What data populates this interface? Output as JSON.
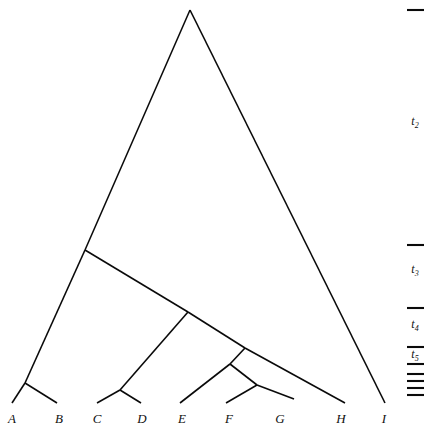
{
  "figure": {
    "kind": "phylogenetic-tree-diagram",
    "width": 428,
    "height": 428,
    "background_color": "#ffffff",
    "line_color": "#0a0a0a"
  },
  "chart_data": {
    "type": "diagram",
    "subtype": "cladogram",
    "title": "",
    "xlabel": "",
    "ylabel": "",
    "grid": false,
    "legend": null,
    "taxa": [
      {
        "id": "A",
        "label": "A",
        "x": 12,
        "y": 403,
        "label_x": 12,
        "label_y": 411
      },
      {
        "id": "B",
        "label": "B",
        "x": 55,
        "y": 403,
        "label_x": 59,
        "label_y": 411
      },
      {
        "id": "C",
        "label": "C",
        "x": 97,
        "y": 403,
        "label_x": 97,
        "label_y": 411
      },
      {
        "id": "D",
        "label": "D",
        "x": 138,
        "y": 403,
        "label_x": 142,
        "label_y": 411
      },
      {
        "id": "E",
        "label": "E",
        "x": 180,
        "y": 403,
        "label_x": 182,
        "label_y": 411
      },
      {
        "id": "F",
        "label": "F",
        "x": 226,
        "y": 403,
        "label_x": 229,
        "label_y": 411
      },
      {
        "id": "G",
        "label": "G",
        "x": 280,
        "y": 403,
        "label_x": 280,
        "label_y": 411
      },
      {
        "id": "H",
        "label": "H",
        "x": 345,
        "y": 403,
        "label_x": 341,
        "label_y": 411
      },
      {
        "id": "I",
        "label": "I",
        "x": 385,
        "y": 403,
        "label_x": 384,
        "label_y": 411
      }
    ],
    "internal_nodes": [
      {
        "id": "root",
        "x": 190,
        "y": 10
      },
      {
        "id": "n_left",
        "x": 85,
        "y": 250
      },
      {
        "id": "n_cde_fg",
        "x": 188,
        "y": 312
      },
      {
        "id": "n_efg",
        "x": 245,
        "y": 348
      },
      {
        "id": "n_fg_parent",
        "x": 230,
        "y": 364
      },
      {
        "id": "n_ab",
        "x": 25,
        "y": 383
      },
      {
        "id": "n_cd",
        "x": 120,
        "y": 390
      },
      {
        "id": "n_fg",
        "x": 257,
        "y": 385
      }
    ],
    "branches": [
      {
        "from": "root",
        "to": "n_left",
        "x1": 190,
        "y1": 10,
        "x2": 85,
        "y2": 250
      },
      {
        "from": "root",
        "to": "I",
        "x1": 190,
        "y1": 10,
        "x2": 385,
        "y2": 403
      },
      {
        "from": "n_left",
        "to": "n_ab",
        "x1": 85,
        "y1": 250,
        "x2": 25,
        "y2": 383
      },
      {
        "from": "n_left",
        "to": "n_cde_fg",
        "x1": 85,
        "y1": 250,
        "x2": 188,
        "y2": 312
      },
      {
        "from": "n_cde_fg",
        "to": "n_cd",
        "x1": 188,
        "y1": 312,
        "x2": 120,
        "y2": 390
      },
      {
        "from": "n_cde_fg",
        "to": "n_efg",
        "x1": 188,
        "y1": 312,
        "x2": 245,
        "y2": 348
      },
      {
        "from": "n_efg",
        "to": "n_fg_parent",
        "x1": 245,
        "y1": 348,
        "x2": 230,
        "y2": 364
      },
      {
        "from": "n_efg",
        "to": "H",
        "x1": 245,
        "y1": 348,
        "x2": 345,
        "y2": 403
      },
      {
        "from": "n_fg_parent",
        "to": "E",
        "x1": 230,
        "y1": 364,
        "x2": 180,
        "y2": 403
      },
      {
        "from": "n_fg_parent",
        "to": "n_fg",
        "x1": 230,
        "y1": 364,
        "x2": 257,
        "y2": 385
      },
      {
        "from": "n_fg",
        "to": "F",
        "x1": 257,
        "y1": 385,
        "x2": 226,
        "y2": 403
      },
      {
        "from": "n_fg",
        "to": "G",
        "x1": 257,
        "y1": 385,
        "x2": 294,
        "y2": 399
      },
      {
        "from": "n_ab",
        "to": "A",
        "x1": 25,
        "y1": 383,
        "x2": 12,
        "y2": 403
      },
      {
        "from": "n_ab",
        "to": "B",
        "x1": 25,
        "y1": 383,
        "x2": 57,
        "y2": 403
      },
      {
        "from": "n_cd",
        "to": "C",
        "x1": 120,
        "y1": 390,
        "x2": 97,
        "y2": 403
      },
      {
        "from": "n_cd",
        "to": "D",
        "x1": 120,
        "y1": 390,
        "x2": 141,
        "y2": 403
      }
    ],
    "time_axis": {
      "position": "right",
      "ticks": [
        {
          "y": 10,
          "x1": 407,
          "x2": 424
        },
        {
          "y": 245,
          "x1": 407,
          "x2": 424
        },
        {
          "y": 308,
          "x1": 407,
          "x2": 424
        },
        {
          "y": 347,
          "x1": 407,
          "x2": 424
        },
        {
          "y": 364,
          "x1": 407,
          "x2": 424
        },
        {
          "y": 374,
          "x1": 407,
          "x2": 424
        },
        {
          "y": 381,
          "x1": 407,
          "x2": 424
        },
        {
          "y": 388,
          "x1": 407,
          "x2": 424
        },
        {
          "y": 395,
          "x1": 407,
          "x2": 424
        }
      ],
      "labels": [
        {
          "id": "t2",
          "base": "t",
          "sub": "2",
          "x": 415,
          "y": 122
        },
        {
          "id": "t3",
          "base": "t",
          "sub": "3",
          "x": 415,
          "y": 270
        },
        {
          "id": "t4",
          "base": "t",
          "sub": "4",
          "x": 415,
          "y": 325
        },
        {
          "id": "t5",
          "base": "t",
          "sub": "5",
          "x": 415,
          "y": 355
        }
      ]
    }
  }
}
